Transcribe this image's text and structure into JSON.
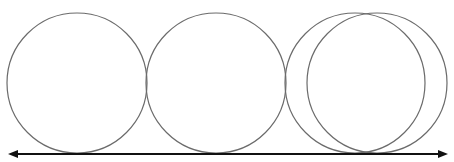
{
  "diagram": {
    "stroke_color": "#6b6b6b",
    "line_color": "#111111",
    "background": "#ffffff",
    "circles": [
      {
        "id": "circle-1",
        "cx": 77,
        "cy": 83,
        "r": 70
      },
      {
        "id": "circle-2",
        "cx": 216,
        "cy": 83,
        "r": 70
      },
      {
        "id": "circle-3",
        "cx": 355,
        "cy": 83,
        "r": 70
      },
      {
        "id": "circle-4",
        "cx": 377,
        "cy": 83,
        "r": 70,
        "partial": true
      }
    ],
    "baseline": {
      "x1": 8,
      "x2": 448,
      "y": 154,
      "arrows": "both"
    }
  }
}
